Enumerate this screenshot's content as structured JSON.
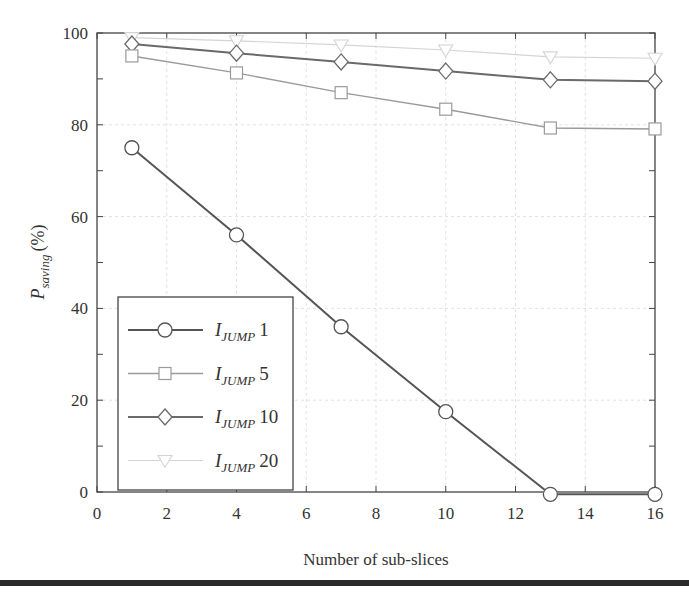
{
  "chart_data": {
    "type": "line",
    "title": "",
    "xlabel": "Number of sub-slices",
    "ylabel": "P_saving (%)",
    "ylabel_main": "P",
    "ylabel_sub": "saving",
    "ylabel_suffix": "(%)",
    "xlim": [
      0,
      16
    ],
    "ylim": [
      0,
      100
    ],
    "xticks": [
      0,
      2,
      4,
      6,
      8,
      10,
      12,
      14,
      16
    ],
    "yticks": [
      0,
      20,
      40,
      60,
      80,
      100
    ],
    "grid": true,
    "legend_position": "lower left",
    "x": [
      1,
      4,
      7,
      10,
      13,
      16
    ],
    "series": [
      {
        "name": "I_JUMP 1",
        "legend_main": "I",
        "legend_sub": "JUMP",
        "legend_num": "1",
        "marker": "circle",
        "color": "#555555",
        "width": 2,
        "values": [
          75,
          56,
          36,
          17.5,
          -0.5,
          -0.5
        ]
      },
      {
        "name": "I_JUMP 5",
        "legend_main": "I",
        "legend_sub": "JUMP",
        "legend_num": "5",
        "marker": "square",
        "color": "#9a9a9a",
        "width": 1.4,
        "values": [
          95,
          91.3,
          87,
          83.4,
          79.3,
          79.1
        ]
      },
      {
        "name": "I_JUMP 10",
        "legend_main": "I",
        "legend_sub": "JUMP",
        "legend_num": "10",
        "marker": "diamond",
        "color": "#6a6a6a",
        "width": 2,
        "values": [
          97.6,
          95.6,
          93.7,
          91.7,
          89.8,
          89.5
        ]
      },
      {
        "name": "I_JUMP 20",
        "legend_main": "I",
        "legend_sub": "JUMP",
        "legend_num": "20",
        "marker": "triangle-down",
        "color": "#d4d4d4",
        "width": 1.2,
        "values": [
          99,
          98.3,
          97.4,
          96.3,
          94.8,
          94.5
        ]
      }
    ]
  }
}
